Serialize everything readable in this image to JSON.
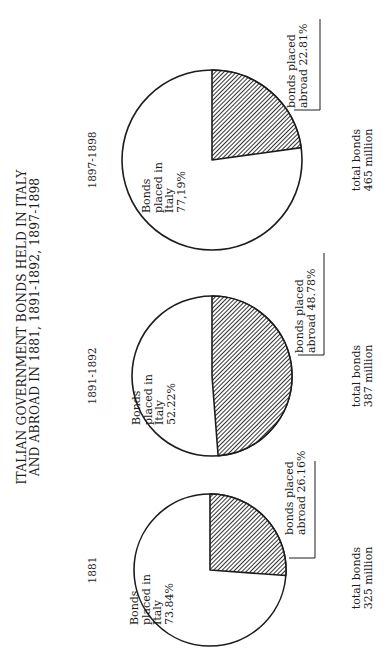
{
  "chart_data": {
    "type": "pie",
    "title": "ITALIAN GOVERNMENT BONDS HELD IN ITALY AND ABROAD IN 1881, 1891-1892, 1897-1898",
    "title_lines": [
      "ITALIAN GOVERNMENT BONDS HELD IN ITALY",
      "AND ABROAD IN 1881, 1891-1892, 1897-1898"
    ],
    "orientation": "rotated 90 degrees counter-clockwise",
    "pies": [
      {
        "period": "1881",
        "total_label": [
          "total bonds",
          "325 million"
        ],
        "total_millions": 325,
        "slices": [
          {
            "name": "Bonds placed in Italy",
            "value": 73.84,
            "label_lines": [
              "Bonds",
              "placed in",
              "Italy",
              "73.84%"
            ],
            "fill": "white"
          },
          {
            "name": "bonds placed abroad",
            "value": 26.16,
            "label_lines": [
              "bonds placed",
              "abroad 26.16%"
            ],
            "fill": "hatched"
          }
        ]
      },
      {
        "period": "1891-1892",
        "total_label": [
          "total bonds",
          "387 million"
        ],
        "total_millions": 387,
        "slices": [
          {
            "name": "Bonds placed in Italy",
            "value": 52.22,
            "label_lines": [
              "Bonds",
              "placed in",
              "Italy",
              "52.22%"
            ],
            "fill": "white"
          },
          {
            "name": "bonds placed abroad",
            "value": 48.78,
            "label_lines": [
              "bonds placed",
              "abroad 48.78%"
            ],
            "fill": "hatched"
          }
        ]
      },
      {
        "period": "1897-1898",
        "total_label": [
          "total bonds",
          "465 million"
        ],
        "total_millions": 465,
        "slices": [
          {
            "name": "Bonds placed in Italy",
            "value": 77.19,
            "label_lines": [
              "Bonds",
              "placed in",
              "Italy",
              "77,19%"
            ],
            "fill": "white"
          },
          {
            "name": "bonds placed abroad",
            "value": 22.81,
            "label_lines": [
              "bonds placed",
              "abroad 22.81%"
            ],
            "fill": "hatched"
          }
        ]
      }
    ],
    "colors": {
      "ink": "#1c1c1c",
      "background": "#ffffff"
    }
  }
}
